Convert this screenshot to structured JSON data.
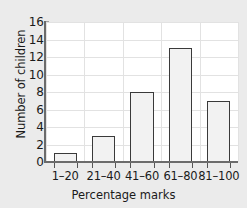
{
  "chart_data": {
    "type": "bar",
    "title": "",
    "categories": [
      "1–20",
      "21–40",
      "41–60",
      "61–80",
      "81–100"
    ],
    "values": [
      1,
      3,
      8,
      13,
      7
    ],
    "xlabel": "Percentage marks",
    "ylabel": "Number of children",
    "ylim": [
      0,
      16
    ],
    "ytick_labels": [
      "0",
      "2",
      "4",
      "6",
      "8",
      "10",
      "12",
      "14",
      "16"
    ],
    "ytick_values": [
      0,
      2,
      4,
      6,
      8,
      10,
      12,
      14,
      16
    ],
    "grid": true,
    "legend": "none",
    "bar_fill_color": "#f2f2f2",
    "bar_edge_color": "#3a3a3a",
    "plot_background": "#ffffff",
    "figure_background": "#ebebeb",
    "grid_color": "#e2e2e2",
    "axis_color": "#6b6b6b"
  }
}
